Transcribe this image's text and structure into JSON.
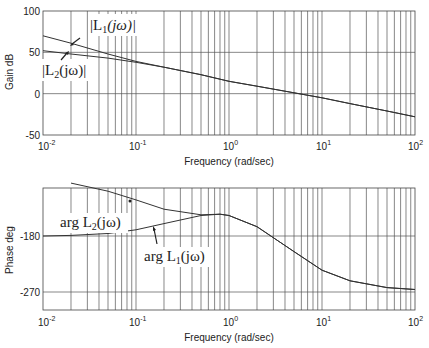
{
  "chart_data": [
    {
      "type": "line",
      "title": "",
      "xlabel": "Frequency (rad/sec)",
      "ylabel": "Gain dB",
      "xscale": "log",
      "xlim": [
        0.01,
        100
      ],
      "ylim": [
        -50,
        100
      ],
      "xticks": [
        "10^-2",
        "10^-1",
        "10^0",
        "10^1",
        "10^2"
      ],
      "yticks": [
        "-50",
        "0",
        "50",
        "100"
      ],
      "grid": true,
      "series": [
        {
          "name": "|L1(jω)|",
          "x": [
            0.01,
            0.02,
            0.05,
            0.1,
            0.2,
            0.5,
            1,
            2,
            5,
            10,
            20,
            50,
            100
          ],
          "values": [
            70,
            61,
            48,
            39,
            32,
            23,
            15,
            9,
            1,
            -5,
            -12,
            -21,
            -28
          ]
        },
        {
          "name": "|L2(jω)|",
          "x": [
            0.01,
            0.02,
            0.05,
            0.1,
            0.2,
            0.5,
            1,
            2,
            5,
            10,
            20,
            50,
            100
          ],
          "values": [
            52,
            48,
            43,
            38,
            32,
            23,
            15,
            9,
            1,
            -5,
            -12,
            -21,
            -28
          ]
        }
      ],
      "annotations": [
        "|L1(jω)|",
        "|L2(jω)|"
      ]
    },
    {
      "type": "line",
      "title": "",
      "xlabel": "Frequency (rad/sec)",
      "ylabel": "Phase deg",
      "xscale": "log",
      "xlim": [
        0.01,
        100
      ],
      "ylim": [
        -300,
        -95
      ],
      "xticks": [
        "10^-2",
        "10^-1",
        "10^0",
        "10^1",
        "10^2"
      ],
      "yticks": [
        "-270",
        "-180"
      ],
      "grid": true,
      "series": [
        {
          "name": "arg L1(jω)",
          "x": [
            0.01,
            0.02,
            0.05,
            0.1,
            0.2,
            0.5,
            0.8,
            1,
            2,
            5,
            10,
            20,
            50,
            100
          ],
          "values": [
            -180,
            -179,
            -176,
            -170,
            -160,
            -147,
            -145,
            -147,
            -165,
            -205,
            -235,
            -252,
            -263,
            -266
          ]
        },
        {
          "name": "arg L2(jω)",
          "x": [
            0.02,
            0.05,
            0.1,
            0.2,
            0.5,
            0.8,
            1,
            2,
            5,
            10,
            20,
            50,
            100
          ],
          "values": [
            -95,
            -108,
            -122,
            -137,
            -146,
            -145,
            -147,
            -165,
            -205,
            -235,
            -252,
            -263,
            -266
          ]
        }
      ],
      "annotations": [
        "arg L2(jω)",
        "arg L1(jω)"
      ]
    }
  ],
  "gain_plot": {
    "ylabel": "Gain dB",
    "yticks": {
      "t100": "100",
      "t50": "50",
      "t0": "0",
      "tm50": "-50"
    },
    "xticks": {
      "m2": "10",
      "m2exp": "-2",
      "m1": "10",
      "m1exp": "-1",
      "z": "10",
      "zexp": "0",
      "p1": "10",
      "p1exp": "1",
      "p2": "10",
      "p2exp": "2"
    },
    "xlabel": "Frequency (rad/sec)",
    "annotation_L1": "|L",
    "annotation_L1_sub": "1",
    "annotation_L1_tail": "(jω)|",
    "annotation_L2": "|L",
    "annotation_L2_sub": "2",
    "annotation_L2_tail": "(jω)|"
  },
  "phase_plot": {
    "ylabel": "Phase deg",
    "yticks": {
      "tm180": "-180",
      "tm270": "-270"
    },
    "xticks": {
      "m2": "10",
      "m2exp": "-2",
      "m1": "10",
      "m1exp": "-1",
      "z": "10",
      "zexp": "0",
      "p1": "10",
      "p1exp": "1",
      "p2": "10",
      "p2exp": "2"
    },
    "xlabel": "Frequency (rad/sec)",
    "annotation_L2": "arg L",
    "annotation_L2_sub": "2",
    "annotation_L2_tail": "(jω)",
    "annotation_L1": "arg L",
    "annotation_L1_sub": "1",
    "annotation_L1_tail": "(jω)"
  }
}
